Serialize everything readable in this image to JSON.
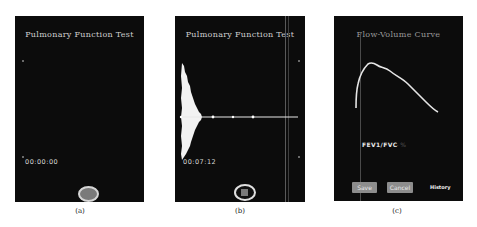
{
  "panels": [
    {
      "id": "a",
      "title": "Pulmonary Function Test",
      "timer": "00:00:00",
      "record_button": "start",
      "caption": "(a)"
    },
    {
      "id": "b",
      "title": "Pulmonary Function Test",
      "timer": "00:07:12",
      "record_button": "stop",
      "caption": "(b)"
    },
    {
      "id": "c",
      "title": "Flow-Volume Curve",
      "metric_label": "FEV1/FVC",
      "metric_value": "-- %",
      "buttons": {
        "save": "Save",
        "cancel": "Cancel",
        "history": "History"
      },
      "caption": "(c)"
    }
  ],
  "colors": {
    "panel_bg": "#0c0c0c",
    "record_fill": "#7a7a7a",
    "button_bg": "#8d8d8d",
    "curve": "#e6e6e6"
  }
}
